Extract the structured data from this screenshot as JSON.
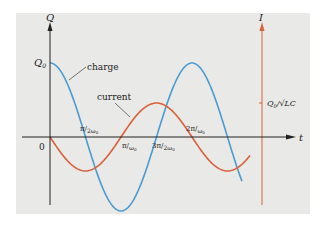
{
  "diagram": {
    "q_axis_label": "Q",
    "i_axis_label": "I",
    "t_axis_label": "t",
    "q0_label": "Q",
    "q0_sub": "0",
    "origin_label": "0",
    "current_amp_label": "Q",
    "current_amp_sub": "0",
    "current_amp_rest": "/√LC",
    "charge_label": "charge",
    "current_label": "current",
    "ticks": [
      {
        "num": "π",
        "den": "2ω",
        "sub": "0"
      },
      {
        "num": "π",
        "den": "ω",
        "sub": "0"
      },
      {
        "num": "3π",
        "den": "2ω",
        "sub": "0"
      },
      {
        "num": "2π",
        "den": "ω",
        "sub": "0"
      }
    ],
    "colors": {
      "charge": "#4b9bd0",
      "current": "#d9603a",
      "axis": "#222222",
      "i_axis": "#d9603a",
      "background": "#e9e9e7"
    }
  },
  "chart_data": {
    "type": "line",
    "title": "",
    "xlabel": "t",
    "ylabel": "Q (left), I (right)",
    "series": [
      {
        "name": "charge",
        "formula": "Q0 cos(ω0 t)",
        "x": [
          0,
          0.25,
          0.5,
          0.75,
          1.0,
          1.25,
          1.5,
          1.75,
          2.0,
          2.25
        ],
        "x_unit": "π/ω0",
        "values": [
          1,
          0.707,
          0,
          -0.707,
          -1,
          -0.707,
          0,
          0.707,
          1,
          0.707
        ]
      },
      {
        "name": "current",
        "formula": "-(Q0/√LC) sin(ω0 t)",
        "x": [
          0,
          0.25,
          0.5,
          0.75,
          1.0,
          1.25,
          1.5,
          1.75,
          2.0,
          2.25
        ],
        "x_unit": "π/ω0",
        "values": [
          0,
          -0.707,
          -1,
          -0.707,
          0,
          0.707,
          1,
          0.707,
          0,
          -0.707
        ]
      }
    ],
    "x_ticks": [
      "0",
      "π/2ω0",
      "π/ω0",
      "3π/2ω0",
      "2π/ω0"
    ],
    "y_ticks_left": [
      "Q0"
    ],
    "y_ticks_right": [
      "Q0/√LC"
    ]
  }
}
